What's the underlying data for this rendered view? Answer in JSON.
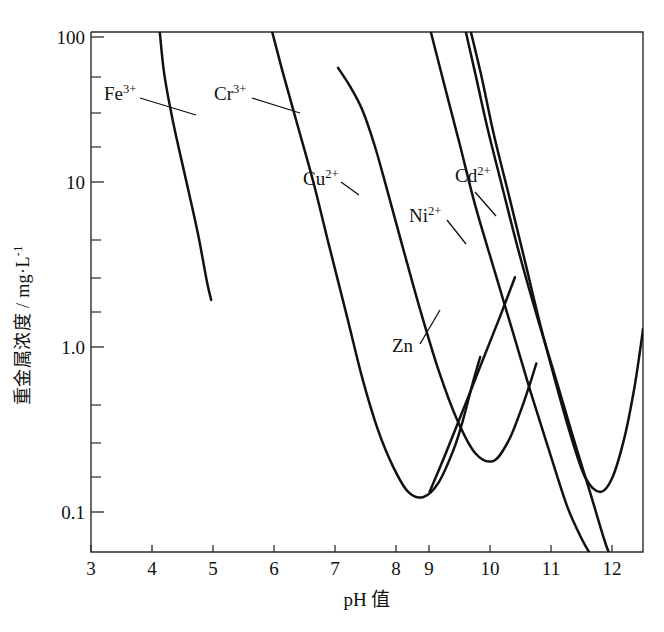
{
  "chart_data": {
    "type": "line",
    "title": "",
    "xlabel": "pH 值",
    "ylabel": "重金属浓度 / mg·L⁻¹",
    "ylabel_main": "重金属浓度 / mg·L",
    "ylabel_exponent": "-1",
    "xscale": "linear",
    "yscale": "log",
    "xlim": [
      3,
      12.5
    ],
    "ylim": [
      0.06,
      130
    ],
    "grid": false,
    "legend": "inline-labels",
    "xticks": [
      "3",
      "4",
      "5",
      "6",
      "7",
      "8",
      "9",
      "10",
      "11",
      "12"
    ],
    "xtick_values": [
      3,
      4,
      5,
      6,
      7,
      8,
      9,
      10,
      11,
      12
    ],
    "yticks": [
      "100",
      "10",
      "1.0",
      "0.1"
    ],
    "ytick_values": [
      100,
      10,
      1.0,
      0.1
    ],
    "yminor_values": [
      60,
      40,
      20,
      6,
      4,
      2,
      0.6,
      0.4,
      0.2
    ],
    "series": [
      {
        "name": "Fe3+",
        "label": "Fe",
        "charge": "3+",
        "label_pos": {
          "x": 104,
          "y": 100
        },
        "leader": [
          [
            140,
            98
          ],
          [
            196,
            115
          ]
        ],
        "points": [
          [
            4.12,
            115
          ],
          [
            4.2,
            60
          ],
          [
            4.35,
            30
          ],
          [
            4.55,
            14
          ],
          [
            4.75,
            6.5
          ],
          [
            4.9,
            3.3
          ],
          [
            4.97,
            2.55
          ]
        ]
      },
      {
        "name": "Cr3+",
        "label": "Cr",
        "charge": "3+",
        "label_pos": {
          "x": 214,
          "y": 100
        },
        "leader": [
          [
            252,
            98
          ],
          [
            300,
            113
          ]
        ],
        "points": [
          [
            5.95,
            115
          ],
          [
            6.15,
            60
          ],
          [
            6.4,
            28
          ],
          [
            6.65,
            13
          ],
          [
            6.9,
            5.5
          ],
          [
            7.2,
            2.0
          ],
          [
            7.45,
            0.85
          ],
          [
            7.7,
            0.42
          ],
          [
            7.95,
            0.25
          ],
          [
            8.2,
            0.175
          ],
          [
            8.45,
            0.163
          ],
          [
            8.7,
            0.2
          ],
          [
            8.95,
            0.32
          ],
          [
            9.1,
            0.48
          ],
          [
            9.25,
            0.78
          ],
          [
            9.38,
            1.15
          ]
        ]
      },
      {
        "name": "Cu2+",
        "label": "Cu",
        "charge": "2+",
        "label_pos": {
          "x": 303,
          "y": 185
        },
        "leader": [
          [
            341,
            182
          ],
          [
            359,
            195
          ]
        ],
        "points": [
          [
            7.05,
            65
          ],
          [
            7.25,
            50
          ],
          [
            7.45,
            36
          ],
          [
            7.65,
            22
          ],
          [
            7.85,
            12
          ],
          [
            8.1,
            5.5
          ],
          [
            8.4,
            2.2
          ],
          [
            8.7,
            0.95
          ],
          [
            9.0,
            0.48
          ],
          [
            9.3,
            0.3
          ],
          [
            9.6,
            0.27
          ],
          [
            9.85,
            0.36
          ],
          [
            10.05,
            0.55
          ],
          [
            10.2,
            0.8
          ],
          [
            10.3,
            1.05
          ]
        ]
      },
      {
        "name": "Ni2+",
        "label": "Ni",
        "charge": "2+",
        "label_pos": {
          "x": 409,
          "y": 222
        },
        "leader": [
          [
            447,
            220
          ],
          [
            466,
            244
          ]
        ],
        "points": [
          [
            8.55,
            115
          ],
          [
            8.8,
            50
          ],
          [
            9.05,
            22
          ],
          [
            9.3,
            9.5
          ],
          [
            9.6,
            4.0
          ],
          [
            9.9,
            1.7
          ],
          [
            10.2,
            0.72
          ],
          [
            10.5,
            0.32
          ],
          [
            10.8,
            0.145
          ],
          [
            11.05,
            0.09
          ],
          [
            11.2,
            0.072
          ]
        ]
      },
      {
        "name": "Cd2+",
        "label": "Cd",
        "charge": "2+",
        "label_pos": {
          "x": 455,
          "y": 182
        },
        "leader": [
          [
            475,
            192
          ],
          [
            496,
            216
          ]
        ],
        "points": [
          [
            9.12,
            118
          ],
          [
            9.3,
            60
          ],
          [
            9.5,
            28
          ],
          [
            9.75,
            12
          ],
          [
            10.0,
            5.2
          ],
          [
            10.3,
            2.1
          ],
          [
            10.6,
            0.9
          ],
          [
            10.9,
            0.38
          ],
          [
            11.2,
            0.165
          ],
          [
            11.45,
            0.082
          ],
          [
            11.6,
            0.062
          ]
        ]
      },
      {
        "name": "Zn",
        "label": "Zn",
        "charge": "",
        "label_pos": {
          "x": 392,
          "y": 352
        },
        "leader": [
          [
            420,
            344
          ],
          [
            440,
            310
          ]
        ],
        "points": [
          [
            9.2,
            118
          ],
          [
            9.4,
            58
          ],
          [
            9.6,
            26
          ],
          [
            9.85,
            11
          ],
          [
            10.1,
            4.6
          ],
          [
            10.35,
            1.9
          ],
          [
            10.6,
            0.85
          ],
          [
            10.85,
            0.4
          ],
          [
            11.1,
            0.215
          ],
          [
            11.35,
            0.175
          ],
          [
            11.55,
            0.215
          ],
          [
            11.75,
            0.38
          ],
          [
            11.9,
            0.72
          ],
          [
            12.0,
            1.25
          ],
          [
            12.05,
            1.7
          ]
        ]
      },
      {
        "name": "Cd2+-descending-branch",
        "label": "",
        "charge": "",
        "label_pos": {
          "x": 0,
          "y": 0
        },
        "leader": [],
        "points": [
          [
            9.95,
            3.5
          ],
          [
            9.7,
            2.0
          ],
          [
            9.4,
            1.05
          ],
          [
            9.1,
            0.55
          ],
          [
            8.8,
            0.29
          ],
          [
            8.55,
            0.175
          ]
        ]
      }
    ]
  }
}
